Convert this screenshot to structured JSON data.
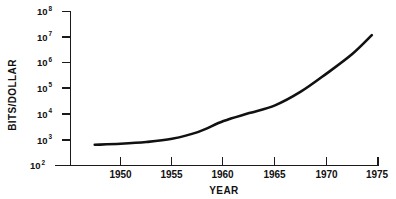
{
  "chart_data": {
    "type": "line",
    "title": "",
    "xlabel": "YEAR",
    "ylabel": "BITS/DOLLAR",
    "yscale": "log",
    "xlim": [
      1947,
      1976
    ],
    "ylim": [
      100,
      100000000
    ],
    "grid": false,
    "legend": null,
    "x_ticks": [
      "1950",
      "1955",
      "1960",
      "1965",
      "1970",
      "1975"
    ],
    "x_tick_values": [
      1950,
      1955,
      1960,
      1965,
      1970,
      1975
    ],
    "y_ticks": [
      "10²",
      "10³",
      "10⁴",
      "10⁵",
      "10⁶",
      "10⁷",
      "10⁸"
    ],
    "y_tick_mantissa": [
      "10",
      "10",
      "10",
      "10",
      "10",
      "10",
      "10"
    ],
    "y_tick_exponents": [
      "2",
      "3",
      "4",
      "5",
      "6",
      "7",
      "8"
    ],
    "y_tick_values": [
      100,
      1000,
      10000,
      100000,
      1000000,
      10000000,
      100000000
    ],
    "series": [
      {
        "name": "Bits per dollar",
        "x": [
          1947.5,
          1950,
          1952.5,
          1955,
          1957.5,
          1960,
          1962.5,
          1965,
          1967.5,
          1970,
          1972.5,
          1974.4
        ],
        "values": [
          640,
          700,
          820,
          1100,
          2000,
          5400,
          11000,
          22000,
          75000,
          380000,
          2200000,
          12000000
        ]
      }
    ],
    "curve_color": "#111111",
    "axis_color": "#1a1a1a",
    "background_color": "#ffffff"
  }
}
